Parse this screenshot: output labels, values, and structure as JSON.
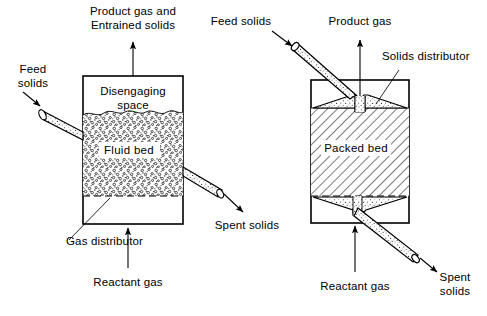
{
  "figure": {
    "background_color": "#ffffff",
    "line_color": "#000000"
  },
  "diagrams": [
    {
      "id": "fluid-bed",
      "name": "Fluid bed reactor",
      "vessel_label": "Fluid bed",
      "interior_label": "Disengaging space",
      "interior_label_lines": [
        "Disengaging",
        "space"
      ],
      "fill_style": "stippled",
      "distributor_style": "dashed",
      "labels": [
        {
          "id": "product-gas",
          "lines": [
            "Product gas and",
            "Entrained solids"
          ],
          "position": "top"
        },
        {
          "id": "feed-solids",
          "lines": [
            "Feed",
            "solids"
          ],
          "position": "left"
        },
        {
          "id": "spent-solids",
          "lines": [
            "Spent solids"
          ],
          "position": "right"
        },
        {
          "id": "gas-distributor",
          "lines": [
            "Gas distributor"
          ],
          "position": "bottom-left"
        },
        {
          "id": "reactant-gas",
          "lines": [
            "Reactant gas"
          ],
          "position": "bottom"
        }
      ]
    },
    {
      "id": "packed-bed",
      "name": "Packed bed reactor",
      "vessel_label": "Packed bed",
      "fill_style": "hatched",
      "distributor_style": "cone",
      "labels": [
        {
          "id": "feed-solids",
          "lines": [
            "Feed solids"
          ],
          "position": "top-left"
        },
        {
          "id": "product-gas",
          "lines": [
            "Product gas"
          ],
          "position": "top"
        },
        {
          "id": "solids-distributor",
          "lines": [
            "Solids distributor"
          ],
          "position": "top-right"
        },
        {
          "id": "reactant-gas",
          "lines": [
            "Reactant gas"
          ],
          "position": "bottom"
        },
        {
          "id": "spent-solids",
          "lines": [
            "Spent",
            "solids"
          ],
          "position": "bottom-right"
        }
      ]
    }
  ],
  "text": {
    "left": {
      "product_gas_line1": "Product gas and",
      "product_gas_line2": "Entrained solids",
      "feed_solids_line1": "Feed",
      "feed_solids_line2": "solids",
      "disengaging_line1": "Disengaging",
      "disengaging_line2": "space",
      "fluid_bed": "Fluid bed",
      "spent_solids": "Spent solids",
      "gas_distributor": "Gas distributor",
      "reactant_gas": "Reactant gas"
    },
    "right": {
      "feed_solids": "Feed solids",
      "product_gas": "Product gas",
      "solids_distributor": "Solids distributor",
      "packed_bed": "Packed bed",
      "reactant_gas": "Reactant gas",
      "spent_solids_line1": "Spent",
      "spent_solids_line2": "solids"
    }
  }
}
